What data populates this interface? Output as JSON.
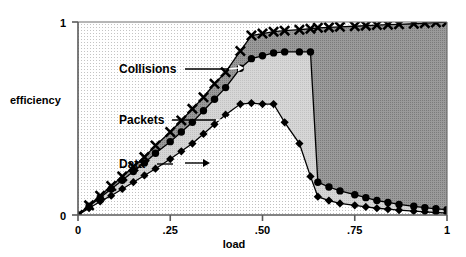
{
  "chart_data": {
    "type": "area",
    "title": "",
    "xlabel": "load",
    "ylabel": "efficiency",
    "xlim": [
      0,
      1
    ],
    "ylim": [
      0,
      1
    ],
    "grid": true,
    "grid_style": "fine dotted grid inside plot area",
    "legend": "inline annotations with leader lines",
    "xticks": [
      0,
      0.25,
      0.5,
      0.75,
      1
    ],
    "xtick_labels": [
      "0",
      ".25",
      ".50",
      ".75",
      "1"
    ],
    "yticks": [
      0,
      1
    ],
    "ytick_labels": [
      "0",
      "1"
    ],
    "x": [
      0.0,
      0.03,
      0.06,
      0.09,
      0.12,
      0.15,
      0.18,
      0.21,
      0.25,
      0.28,
      0.31,
      0.34,
      0.37,
      0.4,
      0.44,
      0.47,
      0.5,
      0.53,
      0.56,
      0.6,
      0.63,
      0.65,
      0.68,
      0.71,
      0.75,
      0.78,
      0.81,
      0.84,
      0.87,
      0.91,
      0.94,
      0.97,
      1.0
    ],
    "series": [
      {
        "name": "Collisions",
        "marker": "x",
        "fill": "dark-gray",
        "values": [
          0.0,
          0.05,
          0.1,
          0.15,
          0.2,
          0.25,
          0.3,
          0.36,
          0.43,
          0.49,
          0.55,
          0.61,
          0.68,
          0.74,
          0.85,
          0.93,
          0.94,
          0.95,
          0.955,
          0.96,
          0.965,
          0.97,
          0.972,
          0.975,
          0.978,
          0.981,
          0.984,
          0.986,
          0.988,
          0.991,
          0.994,
          0.997,
          1.0
        ]
      },
      {
        "name": "Packets",
        "marker": "circle",
        "fill": "light-gray",
        "values": [
          0.0,
          0.045,
          0.09,
          0.135,
          0.18,
          0.225,
          0.27,
          0.32,
          0.38,
          0.43,
          0.48,
          0.54,
          0.6,
          0.66,
          0.76,
          0.81,
          0.825,
          0.84,
          0.845,
          0.845,
          0.845,
          0.17,
          0.145,
          0.125,
          0.105,
          0.09,
          0.075,
          0.065,
          0.055,
          0.045,
          0.038,
          0.032,
          0.028
        ]
      },
      {
        "name": "Data",
        "marker": "diamond",
        "fill": "white",
        "values": [
          0.0,
          0.035,
          0.07,
          0.1,
          0.135,
          0.17,
          0.205,
          0.24,
          0.29,
          0.33,
          0.37,
          0.42,
          0.47,
          0.52,
          0.575,
          0.58,
          0.575,
          0.575,
          0.48,
          0.37,
          0.2,
          0.095,
          0.075,
          0.06,
          0.05,
          0.042,
          0.035,
          0.03,
          0.025,
          0.02,
          0.016,
          0.013,
          0.01
        ]
      }
    ],
    "annotations": [
      {
        "text": "Collisions",
        "points_to_series": "Collisions"
      },
      {
        "text": "Packets",
        "points_to_series": "Packets"
      },
      {
        "text": "Data",
        "points_to_series": "Data"
      }
    ],
    "colors": {
      "collisions_fill": "#8f8f8f",
      "packets_fill": "#cfcfcf",
      "data_fill": "#ffffff",
      "line": "#000000",
      "axis": "#555555",
      "grid": "#b8b8b8"
    }
  }
}
